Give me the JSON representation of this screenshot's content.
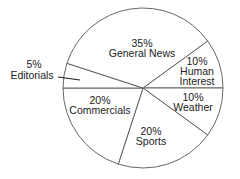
{
  "chart_data": {
    "type": "pie",
    "title": "",
    "slices": [
      {
        "label": "Human Interest",
        "value": 10,
        "percent_label": "10%",
        "lines": [
          "Human",
          "Interest"
        ]
      },
      {
        "label": "Weather",
        "value": 10,
        "percent_label": "10%",
        "lines": [
          "Weather"
        ]
      },
      {
        "label": "Sports",
        "value": 20,
        "percent_label": "20%",
        "lines": [
          "Sports"
        ]
      },
      {
        "label": "Commercials",
        "value": 20,
        "percent_label": "20%",
        "lines": [
          "Commercials"
        ]
      },
      {
        "label": "Editorials",
        "value": 5,
        "percent_label": "5%",
        "lines": [
          "Editorials"
        ]
      },
      {
        "label": "General News",
        "value": 35,
        "percent_label": "35%",
        "lines": [
          "General News"
        ]
      }
    ],
    "legend": "none (labels inside slices; Editorials labeled outside with leader line)",
    "colors": {
      "fill": "#ffffff",
      "stroke": "#555555",
      "text": "#222222"
    }
  }
}
